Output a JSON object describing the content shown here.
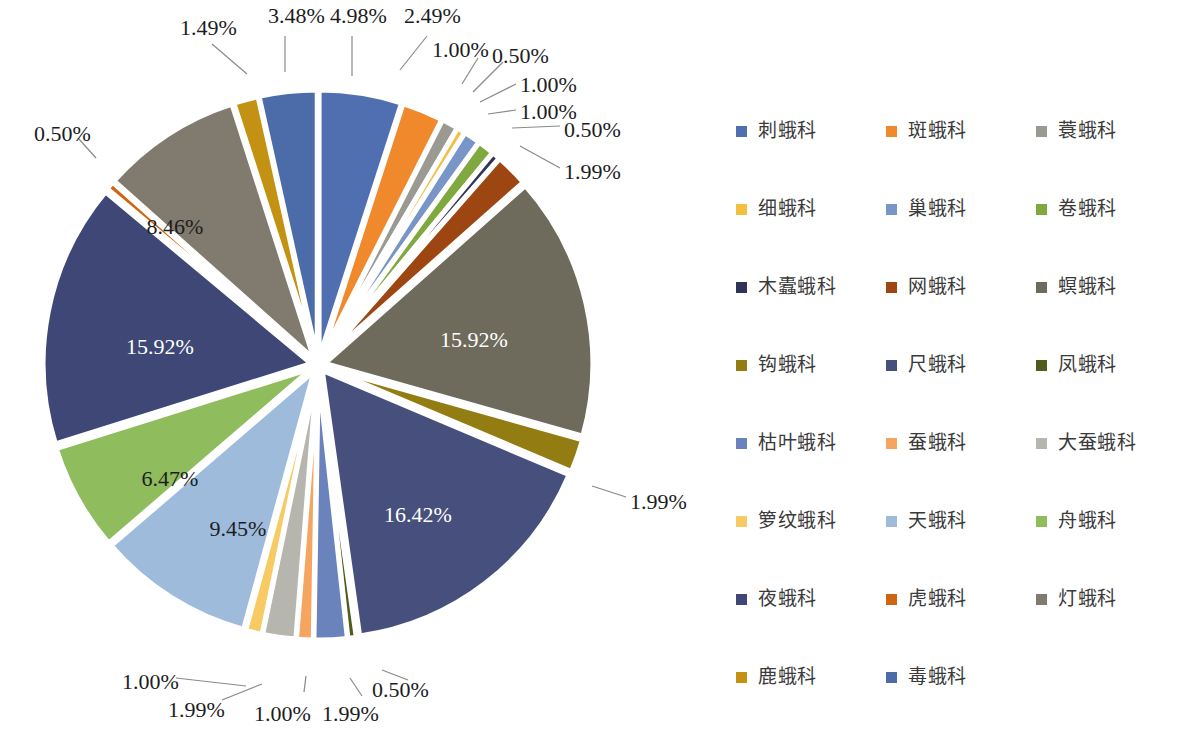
{
  "chart_data": {
    "type": "pie",
    "title": "",
    "subtitle": "",
    "xlabel": "",
    "ylabel": "",
    "legend_position": "right",
    "grid": false,
    "value_unit": "%",
    "label_format": "0.00%",
    "start_angle_deg": 0,
    "direction": "clockwise",
    "exploded": true,
    "categories": [
      "刺蛾科",
      "斑蛾科",
      "蓑蛾科",
      "细蛾科",
      "巢蛾科",
      "卷蛾科",
      "木蠹蛾科",
      "网蛾科",
      "螟蛾科",
      "钩蛾科",
      "尺蛾科",
      "凤蛾科",
      "枯叶蛾科",
      "蚕蛾科",
      "大蚕蛾科",
      "箩纹蛾科",
      "天蛾科",
      "舟蛾科",
      "夜蛾科",
      "虎蛾科",
      "灯蛾科",
      "鹿蛾科",
      "毒蛾科"
    ],
    "values": [
      4.98,
      2.49,
      1.0,
      0.5,
      1.0,
      1.0,
      0.5,
      1.99,
      15.92,
      1.99,
      16.42,
      0.5,
      1.99,
      1.0,
      1.99,
      1.0,
      9.45,
      6.47,
      15.92,
      0.5,
      8.46,
      1.49,
      3.48
    ],
    "value_labels": [
      "4.98%",
      "2.49%",
      "1.00%",
      "0.50%",
      "1.00%",
      "1.00%",
      "0.50%",
      "1.99%",
      "15.92%",
      "1.99%",
      "16.42%",
      "0.50%",
      "1.99%",
      "1.00%",
      "1.99%",
      "1.00%",
      "9.45%",
      "6.47%",
      "15.92%",
      "0.50%",
      "8.46%",
      "1.49%",
      "3.48%"
    ],
    "colors": [
      "#4f6fb0",
      "#f0892c",
      "#9a9a92",
      "#f2bf41",
      "#7795c6",
      "#7fa93e",
      "#2f3355",
      "#9e4612",
      "#6e6a5c",
      "#937c12",
      "#47507d",
      "#4e5c1c",
      "#6b83bd",
      "#f5a55f",
      "#b6b5ae",
      "#f7ca63",
      "#9ebbdc",
      "#8fbc5c",
      "#3e4775",
      "#cf6511",
      "#807b6e",
      "#c39212",
      "#4b6ca8"
    ]
  },
  "legend": {
    "items": [
      {
        "label": "刺蛾科",
        "color": "#4f6fb0"
      },
      {
        "label": "斑蛾科",
        "color": "#f0892c"
      },
      {
        "label": "蓑蛾科",
        "color": "#9a9a92"
      },
      {
        "label": "细蛾科",
        "color": "#f2bf41"
      },
      {
        "label": "巢蛾科",
        "color": "#7795c6"
      },
      {
        "label": "卷蛾科",
        "color": "#7fa93e"
      },
      {
        "label": "木蠹蛾科",
        "color": "#2f3355"
      },
      {
        "label": "网蛾科",
        "color": "#9e4612"
      },
      {
        "label": "螟蛾科",
        "color": "#6e6a5c"
      },
      {
        "label": "钩蛾科",
        "color": "#937c12"
      },
      {
        "label": "尺蛾科",
        "color": "#47507d"
      },
      {
        "label": "凤蛾科",
        "color": "#4e5c1c"
      },
      {
        "label": "枯叶蛾科",
        "color": "#6b83bd"
      },
      {
        "label": "蚕蛾科",
        "color": "#f5a55f"
      },
      {
        "label": "大蚕蛾科",
        "color": "#b6b5ae"
      },
      {
        "label": "箩纹蛾科",
        "color": "#f7ca63"
      },
      {
        "label": "天蛾科",
        "color": "#9ebbdc"
      },
      {
        "label": "舟蛾科",
        "color": "#8fbc5c"
      },
      {
        "label": "夜蛾科",
        "color": "#3e4775"
      },
      {
        "label": "虎蛾科",
        "color": "#cf6511"
      },
      {
        "label": "灯蛾科",
        "color": "#807b6e"
      },
      {
        "label": "鹿蛾科",
        "color": "#c39212"
      },
      {
        "label": "毒蛾科",
        "color": "#4b6ca8"
      }
    ]
  },
  "callouts": [
    {
      "text": "1.49%",
      "x": 180,
      "y": 16,
      "align": "left"
    },
    {
      "text": "3.48%",
      "x": 268,
      "y": 4,
      "align": "left"
    },
    {
      "text": "4.98%",
      "x": 330,
      "y": 4,
      "align": "left"
    },
    {
      "text": "2.49%",
      "x": 404,
      "y": 4,
      "align": "left"
    },
    {
      "text": "1.00%",
      "x": 432,
      "y": 38,
      "align": "left"
    },
    {
      "text": "0.50%",
      "x": 492,
      "y": 44,
      "align": "left"
    },
    {
      "text": "1.00%",
      "x": 520,
      "y": 73,
      "align": "left"
    },
    {
      "text": "1.00%",
      "x": 520,
      "y": 100,
      "align": "left"
    },
    {
      "text": "0.50%",
      "x": 564,
      "y": 118,
      "align": "left"
    },
    {
      "text": "1.99%",
      "x": 564,
      "y": 160,
      "align": "left"
    },
    {
      "text": "0.50%",
      "x": 34,
      "y": 122,
      "align": "left"
    },
    {
      "text": "1.99%",
      "x": 630,
      "y": 490,
      "align": "left"
    },
    {
      "text": "1.00%",
      "x": 122,
      "y": 670,
      "align": "left"
    },
    {
      "text": "1.99%",
      "x": 168,
      "y": 698,
      "align": "left"
    },
    {
      "text": "1.00%",
      "x": 254,
      "y": 702,
      "align": "left"
    },
    {
      "text": "1.99%",
      "x": 322,
      "y": 702,
      "align": "left"
    },
    {
      "text": "0.50%",
      "x": 372,
      "y": 678,
      "align": "left"
    }
  ],
  "inner_labels": [
    {
      "text": "8.46%",
      "x": 175,
      "y": 227,
      "tone": "dark"
    },
    {
      "text": "15.92%",
      "x": 160,
      "y": 347,
      "tone": "light"
    },
    {
      "text": "6.47%",
      "x": 170,
      "y": 479,
      "tone": "dark"
    },
    {
      "text": "9.45%",
      "x": 238,
      "y": 529,
      "tone": "dark"
    },
    {
      "text": "16.42%",
      "x": 418,
      "y": 515,
      "tone": "light"
    },
    {
      "text": "15.92%",
      "x": 474,
      "y": 340,
      "tone": "light"
    }
  ],
  "leaders": [
    {
      "points": "212,44 247,74"
    },
    {
      "points": "285,36 285,72"
    },
    {
      "points": "352,36 352,76"
    },
    {
      "points": "427,36 400,70"
    },
    {
      "points": "478,58 462,84"
    },
    {
      "points": "503,62 473,92"
    },
    {
      "points": "516,84 480,102"
    },
    {
      "points": "516,110 488,114"
    },
    {
      "points": "560,126 512,128"
    },
    {
      "points": "560,168 520,146"
    },
    {
      "points": "78,138 96,158"
    },
    {
      "points": "626,497 592,486"
    },
    {
      "points": "176,678 246,686"
    },
    {
      "points": "222,700 262,684"
    },
    {
      "points": "304,692 306,676"
    },
    {
      "points": "362,696 350,678"
    },
    {
      "points": "408,680 382,670"
    }
  ],
  "geometry": {
    "cx": 318,
    "cy": 365,
    "radius": 268,
    "explode_offset": 7
  }
}
